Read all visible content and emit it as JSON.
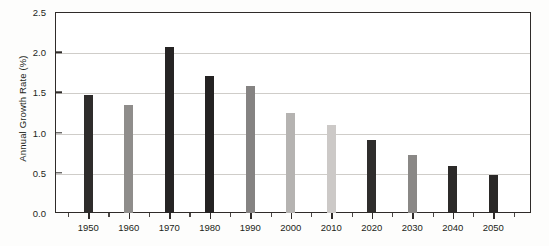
{
  "chart_data": {
    "type": "bar",
    "title": "",
    "xlabel": "",
    "ylabel": "Annual Growth Rate (%)",
    "categories": [
      "1950",
      "1960",
      "1970",
      "1980",
      "1990",
      "2000",
      "2010",
      "2020",
      "2030",
      "2040",
      "2050"
    ],
    "values": [
      1.47,
      1.34,
      2.07,
      1.7,
      1.58,
      1.25,
      1.09,
      0.91,
      0.72,
      0.58,
      0.47
    ],
    "bar_colors": [
      "#2e2c2b",
      "#8f8d8b",
      "#262424",
      "#242222",
      "#858382",
      "#b5b3b1",
      "#ccc9c7",
      "#2f2d2c",
      "#8a8886",
      "#2c2a29",
      "#2a2827"
    ],
    "ylim": [
      0.0,
      2.5
    ],
    "y_ticks": [
      "0.0",
      "0.5",
      "1.0",
      "1.5",
      "2.0",
      "2.5"
    ],
    "y_tick_values": [
      0.0,
      0.5,
      1.0,
      1.5,
      2.0,
      2.5
    ],
    "grid": true,
    "legend": "none",
    "axis_color": "#2f2b29",
    "gridline_color": "#cfcdc9",
    "plot_background": "#ffffff"
  }
}
